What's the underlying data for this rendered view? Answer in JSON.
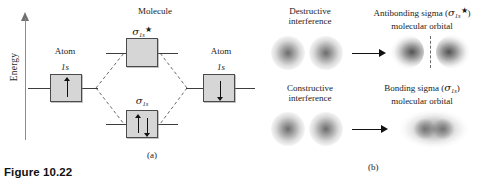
{
  "figure": {
    "caption": "Figure 10.22",
    "panel_a_label": "(a)",
    "panel_b_label": "(b)"
  },
  "panel_a": {
    "axis_label": "Energy",
    "molecule_label": "Molecule",
    "left_atom_label": "Atom",
    "right_atom_label": "Atom",
    "left_orbital_label": "1s",
    "right_orbital_label": "1s",
    "antibonding_sigma": "σ",
    "antibonding_sub": "1s",
    "antibonding_star": "★",
    "bonding_sigma": "σ",
    "bonding_sub": "1s",
    "left_electron": "up",
    "right_electron": "down",
    "bonding_electrons": "up-down pair",
    "antibonding_electrons": "empty"
  },
  "panel_b": {
    "rows": [
      {
        "interference_label_line1": "Destructive",
        "interference_label_line2": "interference",
        "result_line1_pre": "Antibonding sigma (",
        "result_sigma": "σ",
        "result_sub": "1s",
        "result_star": "★",
        "result_line1_post": ")",
        "result_line2": "molecular orbital",
        "has_nodal_plane": true
      },
      {
        "interference_label_line1": "Constructive",
        "interference_label_line2": "interference",
        "result_line1_pre": "Bonding sigma (",
        "result_sigma": "σ",
        "result_sub": "1s",
        "result_star": "",
        "result_line1_post": ")",
        "result_line2": "molecular orbital",
        "has_nodal_plane": false
      }
    ]
  },
  "colors": {
    "box_fill": "#d6d6d6",
    "box_border": "#4a4a4a",
    "line": "#3d3d3d",
    "dashed": "#6a6a6a",
    "text": "#1b1b1b"
  }
}
